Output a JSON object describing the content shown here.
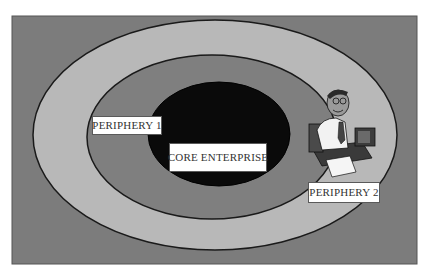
{
  "diagram": {
    "type": "concentric-ellipses",
    "rings": [
      {
        "id": "outer-periphery",
        "fill": "#b8b8b8"
      },
      {
        "id": "inner-periphery",
        "fill": "#7f7f7f"
      },
      {
        "id": "core",
        "fill": "#0a0a0a"
      }
    ],
    "background_fill": "#7c7c7c",
    "outline_color": "#1a1a1a",
    "labels": {
      "periphery_1": "PERIPHERY 1",
      "core": "CORE ENTERPRISE",
      "periphery_2": "PERIPHERY 2"
    },
    "clipart": "businessman-at-computer"
  }
}
